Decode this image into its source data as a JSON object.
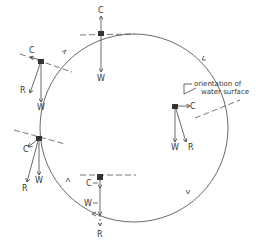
{
  "diagram": {
    "annotation_line1": "orientation of",
    "annotation_line2": "water surface",
    "top": {
      "c": "C",
      "w": "W"
    },
    "upper_left": {
      "c": "C",
      "w": "W",
      "r": "R"
    },
    "right": {
      "c": "C",
      "w": "W",
      "r": "R"
    },
    "lower_left": {
      "c": "C",
      "w": "W",
      "r": "R"
    },
    "bottom": {
      "c": "C",
      "w": "W",
      "r": "R"
    }
  }
}
